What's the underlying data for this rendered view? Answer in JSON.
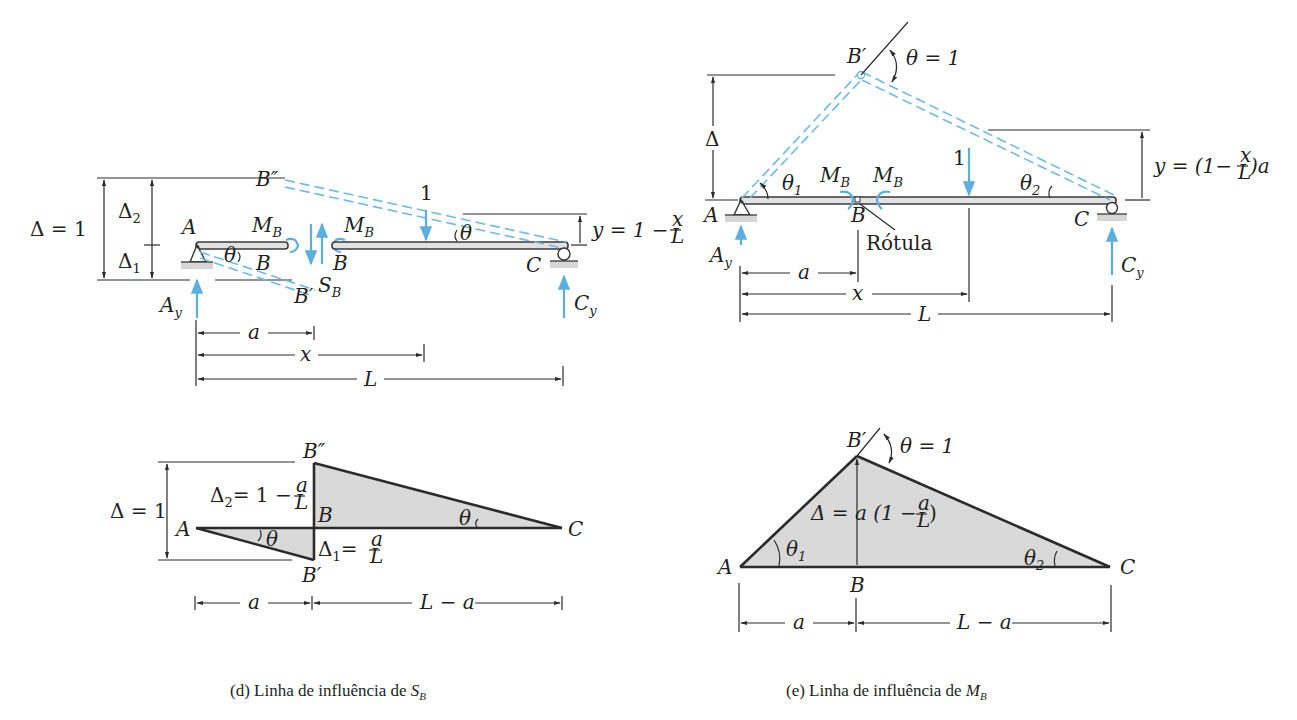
{
  "figure_d": {
    "caption_prefix": "(d) Linha de influência de ",
    "caption_symbol": "S",
    "caption_sub": "B",
    "beam_diagram": {
      "labels": {
        "delta_total": "Δ = 1",
        "delta2": "Δ",
        "delta2_sub": "2",
        "delta1": "Δ",
        "delta1_sub": "1",
        "point_A": "A",
        "point_B_left": "B",
        "point_B_right": "B",
        "point_B_double_prime": "B″",
        "point_B_prime": "B′",
        "point_C": "C",
        "moment_left": "M",
        "moment_left_sub": "B",
        "moment_right": "M",
        "moment_right_sub": "B",
        "shear": "S",
        "shear_sub": "B",
        "theta_left": "θ",
        "theta_right": "θ",
        "unit_load": "1",
        "reaction_A": "A",
        "reaction_A_sub": "y",
        "reaction_C": "C",
        "reaction_C_sub": "y",
        "y_expr": "y = 1 −",
        "y_frac_num": "x",
        "y_frac_den": "L",
        "dim_a": "a",
        "dim_x": "x",
        "dim_L": "L"
      }
    },
    "influence_line": {
      "labels": {
        "delta_total": "Δ = 1",
        "delta2_expr": "Δ",
        "delta2_sub": "2",
        "delta2_rhs": "= 1 −",
        "delta2_frac_num": "a",
        "delta2_frac_den": "L",
        "delta1_expr": "Δ",
        "delta1_sub": "1",
        "delta1_rhs": "=",
        "delta1_frac_num": "a",
        "delta1_frac_den": "L",
        "point_A": "A",
        "point_B": "B",
        "point_B_double_prime": "B″",
        "point_B_prime": "B′",
        "point_C": "C",
        "theta_left": "θ",
        "theta_right": "θ",
        "dim_a": "a",
        "dim_L_minus_a": "L − a"
      }
    }
  },
  "figure_e": {
    "caption_prefix": "(e) Linha de influência de ",
    "caption_symbol": "M",
    "caption_sub": "B",
    "beam_diagram": {
      "labels": {
        "delta": "Δ",
        "point_A": "A",
        "point_B": "B",
        "point_B_prime": "B′",
        "point_C": "C",
        "hinge_label": "Rótula",
        "theta_unit": "θ = 1",
        "theta1": "θ",
        "theta1_sub": "1",
        "theta2": "θ",
        "theta2_sub": "2",
        "moment_left": "M",
        "moment_left_sub": "B",
        "moment_right": "M",
        "moment_right_sub": "B",
        "unit_load": "1",
        "reaction_A": "A",
        "reaction_A_sub": "y",
        "reaction_C": "C",
        "reaction_C_sub": "y",
        "y_expr_left": "y = (1−",
        "y_frac_num": "x",
        "y_frac_den": "L",
        "y_expr_right": ")a",
        "dim_a": "a",
        "dim_x": "x",
        "dim_L": "L"
      }
    },
    "influence_line": {
      "labels": {
        "point_A": "A",
        "point_B": "B",
        "point_B_prime": "B′",
        "point_C": "C",
        "theta_unit": "θ = 1",
        "theta1": "θ",
        "theta1_sub": "1",
        "theta2": "θ",
        "theta2_sub": "2",
        "delta_expr": "Δ = a (1 −",
        "delta_frac_num": "a",
        "delta_frac_den": "L",
        "delta_close": ")",
        "dim_a": "a",
        "dim_L_minus_a": "L − a"
      }
    }
  },
  "colors": {
    "ink": "#231f20",
    "accent_blue": "#5aaee0",
    "shade_gray": "#d9d9d9"
  }
}
